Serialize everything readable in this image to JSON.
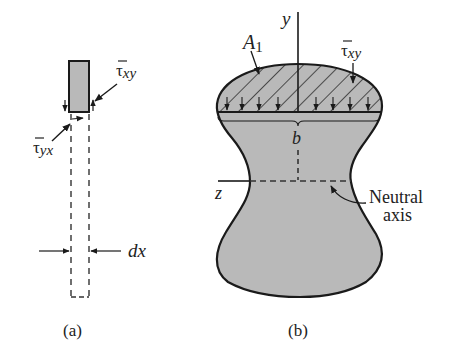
{
  "figure_a": {
    "caption": "(a)",
    "tau_xy": {
      "bar": "τ",
      "sub": "xy"
    },
    "tau_yx": {
      "bar": "τ",
      "sub": "yx"
    },
    "dx_label": "dx"
  },
  "figure_b": {
    "caption": "(b)",
    "y_axis_label": "y",
    "z_axis_label": "z",
    "area_label": {
      "main": "A",
      "sub": "1"
    },
    "tau_xy": {
      "bar": "τ",
      "sub": "xy"
    },
    "width_label": "b",
    "neutral_axis_label": [
      "Neutral",
      "axis"
    ]
  },
  "colors": {
    "fill_gray": "#b9b9b9",
    "stroke": "#1a1a1a",
    "background": "#ffffff"
  }
}
